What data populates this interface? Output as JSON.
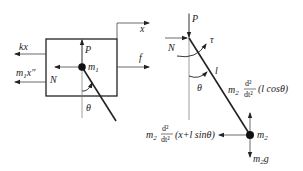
{
  "diagram": {
    "left_fbd": {
      "title": "Cart free-body diagram",
      "labels": {
        "x": "x",
        "kx": "kx",
        "inertia": "m₁x″",
        "inertia_m": "m",
        "inertia_sub": "1",
        "inertia_x": "x″",
        "N": "N",
        "P": "P",
        "m1": "m",
        "m1_sub": "1",
        "f": "f",
        "theta": "θ"
      }
    },
    "right_fbd": {
      "title": "Pendulum free-body diagram",
      "labels": {
        "P": "P",
        "N": "N",
        "tau": "τ",
        "l": "l",
        "theta": "θ",
        "m2": "m",
        "m2_sub": "2",
        "vertical_inertia_coef": "m",
        "vertical_inertia_sub": "2",
        "vertical_inertia_num": "d²",
        "vertical_inertia_den": "dt²",
        "vertical_inertia_arg": "(l cosθ)",
        "horizontal_inertia_coef": "m",
        "horizontal_inertia_sub": "2",
        "horizontal_inertia_num": "d²",
        "horizontal_inertia_den": "dt²",
        "horizontal_inertia_arg": "(x+l sinθ)",
        "weight": "m",
        "weight_sub": "2",
        "weight_g": "g"
      }
    },
    "colors": {
      "line": "#222222",
      "thin": "#555555",
      "background": "#ffffff"
    }
  }
}
